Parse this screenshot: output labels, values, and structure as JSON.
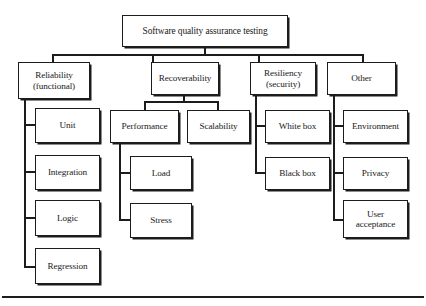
{
  "diagram": {
    "type": "tree-hierarchy",
    "title_node": "Software quality assurance testing",
    "nodes": {
      "root": {
        "label": "Software quality assurance testing"
      },
      "reliability": {
        "label": "Reliability\n(functional)"
      },
      "recoverability": {
        "label": "Recoverability"
      },
      "resiliency": {
        "label": "Resiliency\n(security)"
      },
      "other": {
        "label": "Other"
      },
      "unit": {
        "label": "Unit"
      },
      "integration": {
        "label": "Integration"
      },
      "logic": {
        "label": "Logic"
      },
      "regression": {
        "label": "Regression"
      },
      "performance": {
        "label": "Performance"
      },
      "scalability": {
        "label": "Scalability"
      },
      "load": {
        "label": "Load"
      },
      "stress": {
        "label": "Stress"
      },
      "white_box": {
        "label": "White box"
      },
      "black_box": {
        "label": "Black box"
      },
      "environment": {
        "label": "Environment"
      },
      "privacy": {
        "label": "Privacy"
      },
      "user_acceptance": {
        "label": "User\nacceptance"
      }
    },
    "colors": {
      "box_border": "#1c1c1c",
      "box_fill": "#ffffff",
      "connector": "#1c1c1c",
      "page_background": "#ffffff",
      "text": "#1a1a1a"
    }
  }
}
